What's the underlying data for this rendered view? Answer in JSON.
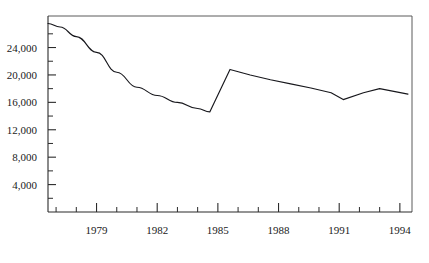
{
  "chart_data": {
    "type": "line",
    "title": "",
    "subtitle": "",
    "xlabel": "",
    "ylabel": "",
    "xlim": [
      1976.6,
      1994.6
    ],
    "ylim": [
      0,
      28600
    ],
    "grid": false,
    "legend": null,
    "y_ticks_major": [
      4000,
      8000,
      12000,
      16000,
      20000,
      24000
    ],
    "y_tick_labels": [
      "4,000",
      "8,000",
      "12,000",
      "16,000",
      "20,000",
      "24,000"
    ],
    "y_ticks_minor": [
      2000,
      6000,
      10000,
      14000,
      18000,
      22000,
      26000
    ],
    "x_ticks_major": [
      1979,
      1982,
      1985,
      1988,
      1991,
      1994
    ],
    "x_tick_labels": [
      "1979",
      "1982",
      "1985",
      "1988",
      "1991",
      "1994"
    ],
    "x_ticks_minor": [
      1977,
      1978,
      1980,
      1981,
      1983,
      1984,
      1986,
      1987,
      1989,
      1990,
      1992,
      1993
    ],
    "series": [
      {
        "name": "series-1",
        "x": [
          1976.6,
          1977.2,
          1978.0,
          1979.0,
          1980.0,
          1981.0,
          1982.0,
          1983.0,
          1984.0,
          1984.6,
          1985.6,
          1986.6,
          1987.6,
          1988.6,
          1989.6,
          1990.6,
          1991.2,
          1992.2,
          1993.0,
          1994.4
        ],
        "y": [
          27500,
          27000,
          25600,
          23300,
          20400,
          18200,
          17000,
          16000,
          15100,
          14600,
          20800,
          20000,
          19300,
          18700,
          18100,
          17400,
          16400,
          17400,
          18000,
          17200
        ]
      }
    ],
    "colors": {
      "line": "#17171c",
      "axis": "#2b2b2b",
      "frame": "#5a5a5a",
      "background": "#ffffff",
      "text": "#1a1a1a"
    }
  }
}
